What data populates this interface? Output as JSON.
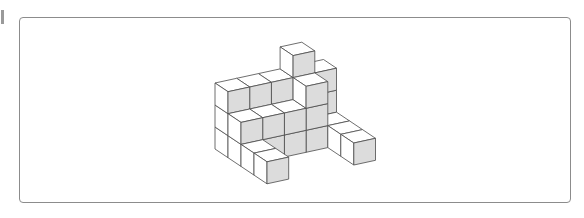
{
  "figure": {
    "colors": {
      "frame": "#8c8c8c",
      "edge": "#4a4a4a",
      "shaded_face": "#dcdcdc",
      "light_face": "#ffffff"
    },
    "geometry": {
      "origin": [
        215,
        83
      ],
      "col_vec": [
        21.7,
        -4.7
      ],
      "depth_vec": [
        13,
        8.7
      ],
      "height": 22
    },
    "cubes": [
      {
        "col": 0,
        "depth": 0,
        "level": 0
      },
      {
        "col": 0,
        "depth": 0,
        "level": 1
      },
      {
        "col": 0,
        "depth": 0,
        "level": 2
      },
      {
        "col": 1,
        "depth": 0,
        "level": 0
      },
      {
        "col": 1,
        "depth": 0,
        "level": 1
      },
      {
        "col": 1,
        "depth": 0,
        "level": 2
      },
      {
        "col": 2,
        "depth": 0,
        "level": 0
      },
      {
        "col": 2,
        "depth": 0,
        "level": 1
      },
      {
        "col": 2,
        "depth": 0,
        "level": 2
      },
      {
        "col": 3,
        "depth": 0,
        "level": 0
      },
      {
        "col": 3,
        "depth": 0,
        "level": 1
      },
      {
        "col": 3,
        "depth": 0,
        "level": 2
      },
      {
        "col": 3,
        "depth": 0,
        "level": 3
      },
      {
        "col": 4,
        "depth": 0,
        "level": 0
      },
      {
        "col": 4,
        "depth": 0,
        "level": 1
      },
      {
        "col": 4,
        "depth": 0,
        "level": 2
      },
      {
        "col": 0,
        "depth": 1,
        "level": 0
      },
      {
        "col": 0,
        "depth": 1,
        "level": 1
      },
      {
        "col": 1,
        "depth": 1,
        "level": 0
      },
      {
        "col": 1,
        "depth": 1,
        "level": 1
      },
      {
        "col": 2,
        "depth": 1,
        "level": 0
      },
      {
        "col": 2,
        "depth": 1,
        "level": 1
      },
      {
        "col": 3,
        "depth": 1,
        "level": 0
      },
      {
        "col": 3,
        "depth": 1,
        "level": 1
      },
      {
        "col": 3,
        "depth": 1,
        "level": 2
      },
      {
        "col": 4,
        "depth": 1,
        "level": 0
      },
      {
        "col": 0,
        "depth": 2,
        "level": 0
      },
      {
        "col": 4,
        "depth": 2,
        "level": 0
      },
      {
        "col": 0,
        "depth": 3,
        "level": 0
      },
      {
        "col": 4,
        "depth": 3,
        "level": 0
      }
    ]
  }
}
